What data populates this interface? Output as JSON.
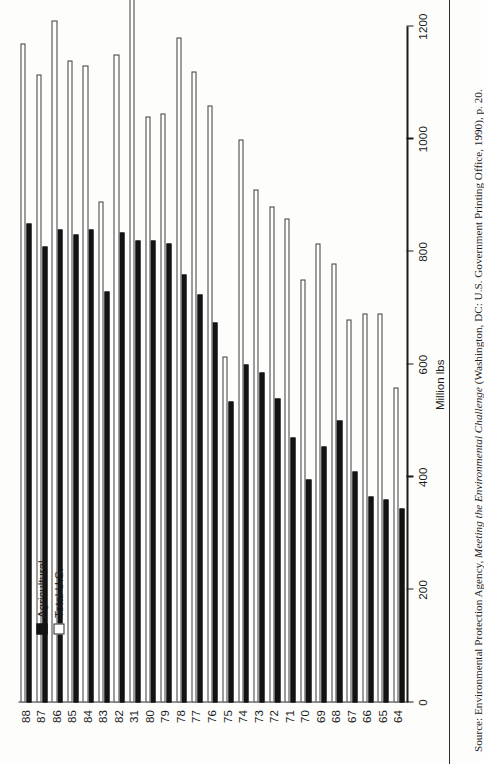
{
  "figure": {
    "axis_title": "Million lbs",
    "legend": [
      {
        "label": "Agricultural",
        "swatch": "filled-black"
      },
      {
        "label": "Total U.S.",
        "swatch": "open-white"
      }
    ],
    "source_prefix": "Source: Environmental Protection Agency, ",
    "source_italic": "Meeting the Environmental Challenge",
    "source_suffix": " (Washington, DC: U.S. Government Printing Office, 1990), p. 20.",
    "rotation": "figure printed rotated 90 degrees (landscape)"
  },
  "chart_data": {
    "type": "bar",
    "title": "",
    "subtitle": "",
    "orientation": "horizontal-paired",
    "xlabel": "",
    "ylabel": "Million lbs",
    "categories": [
      "64",
      "65",
      "66",
      "67",
      "68",
      "69",
      "70",
      "71",
      "72",
      "73",
      "74",
      "75",
      "76",
      "77",
      "78",
      "79",
      "80",
      "31",
      "82",
      "83",
      "84",
      "85",
      "86",
      "87",
      "88"
    ],
    "tick_labels": [
      "0",
      "200",
      "400",
      "600",
      "800",
      "1000",
      "1200"
    ],
    "ylim": [
      0,
      1200
    ],
    "grid": false,
    "legend_position": "left-inside",
    "series": [
      {
        "name": "Agricultural",
        "color": "#131313",
        "values": [
          345,
          360,
          365,
          410,
          500,
          455,
          395,
          470,
          540,
          585,
          600,
          535,
          675,
          725,
          760,
          815,
          820,
          820,
          835,
          730,
          840,
          830,
          840,
          810,
          850
        ]
      },
      {
        "name": "Total U.S.",
        "color": "#ffffff",
        "values": [
          560,
          690,
          690,
          680,
          780,
          815,
          750,
          860,
          880,
          910,
          1000,
          615,
          1060,
          1120,
          1180,
          1045,
          1040,
          1255,
          1150,
          890,
          1130,
          1140,
          1210,
          1115,
          1170
        ]
      }
    ]
  }
}
